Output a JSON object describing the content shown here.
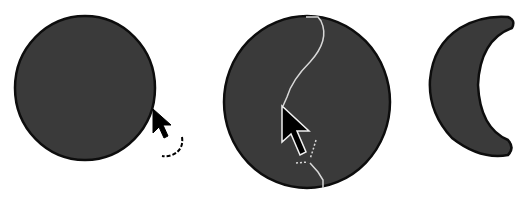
{
  "figure": {
    "panels": [
      {
        "id": "step-1",
        "description": "Filled circle with rotation cursor at edge",
        "cursor": "rotate-cursor"
      },
      {
        "id": "step-2",
        "description": "Filled circle with freehand cut path and arrow cursor",
        "cursor": "knife-arrow-cursor"
      },
      {
        "id": "step-3",
        "description": "Resulting crescent shape",
        "cursor": null
      }
    ],
    "colors": {
      "background": "#ffffff",
      "fill": "#3a3a3a",
      "outline": "#0d0d0d",
      "cut_path": "#d8d8d8",
      "cursor_fill": "#000000",
      "cursor_outline": "#ffffff"
    }
  }
}
